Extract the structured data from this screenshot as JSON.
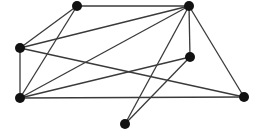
{
  "graph": {
    "colors": {
      "edge": "#3a3a3a",
      "node": "#111111",
      "background": "#ffffff"
    },
    "node_radius": 5,
    "nodes": [
      {
        "id": "A",
        "x": 77,
        "y": 6
      },
      {
        "id": "B",
        "x": 189,
        "y": 6
      },
      {
        "id": "C",
        "x": 20,
        "y": 48
      },
      {
        "id": "D",
        "x": 190,
        "y": 57
      },
      {
        "id": "E",
        "x": 20,
        "y": 98
      },
      {
        "id": "F",
        "x": 244,
        "y": 97
      },
      {
        "id": "G",
        "x": 125,
        "y": 124
      }
    ],
    "edges": [
      [
        "A",
        "B"
      ],
      [
        "A",
        "C"
      ],
      [
        "A",
        "E"
      ],
      [
        "B",
        "C"
      ],
      [
        "B",
        "E"
      ],
      [
        "B",
        "D"
      ],
      [
        "B",
        "F"
      ],
      [
        "B",
        "G"
      ],
      [
        "C",
        "E"
      ],
      [
        "C",
        "F"
      ],
      [
        "E",
        "D"
      ],
      [
        "E",
        "F"
      ],
      [
        "D",
        "G"
      ]
    ]
  }
}
